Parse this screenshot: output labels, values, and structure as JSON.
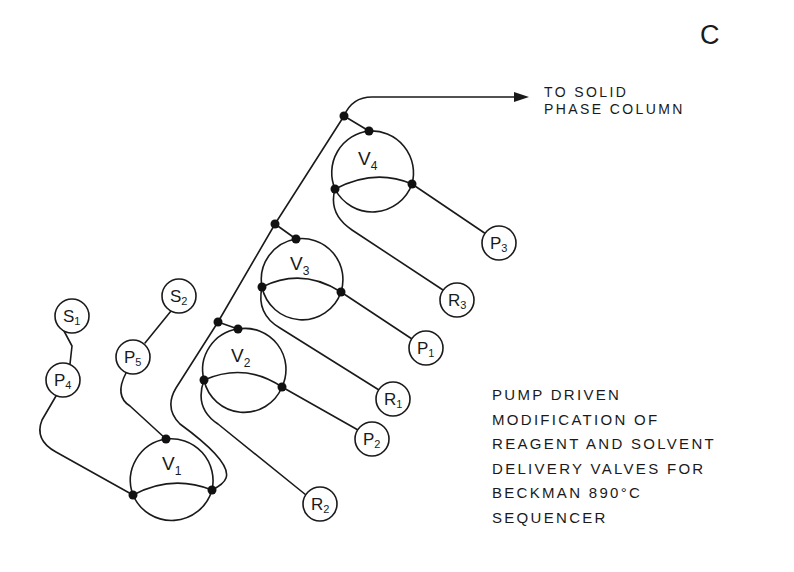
{
  "figure": {
    "panel_letter": "C",
    "destination_label": [
      "TO SOLID",
      "PHASE COLUMN"
    ],
    "caption_lines": [
      "PUMP DRIVEN",
      "MODIFICATION OF",
      "REAGENT AND SOLVENT",
      "DELIVERY VALVES FOR",
      "BECKMAN 890°C",
      "SEQUENCER"
    ],
    "colors": {
      "ink": "#1a1a1a",
      "background": "#ffffff"
    }
  },
  "valves": [
    {
      "id": "V1",
      "letter": "V",
      "subscript": "1"
    },
    {
      "id": "V2",
      "letter": "V",
      "subscript": "2"
    },
    {
      "id": "V3",
      "letter": "V",
      "subscript": "3"
    },
    {
      "id": "V4",
      "letter": "V",
      "subscript": "4"
    }
  ],
  "ports": {
    "S1": {
      "letter": "S",
      "subscript": "1"
    },
    "S2": {
      "letter": "S",
      "subscript": "2"
    },
    "P1": {
      "letter": "P",
      "subscript": "1"
    },
    "P2": {
      "letter": "P",
      "subscript": "2"
    },
    "P3": {
      "letter": "P",
      "subscript": "3"
    },
    "P4": {
      "letter": "P",
      "subscript": "4"
    },
    "P5": {
      "letter": "P",
      "subscript": "5"
    },
    "R1": {
      "letter": "R",
      "subscript": "1"
    },
    "R2": {
      "letter": "R",
      "subscript": "2"
    },
    "R3": {
      "letter": "R",
      "subscript": "3"
    }
  }
}
